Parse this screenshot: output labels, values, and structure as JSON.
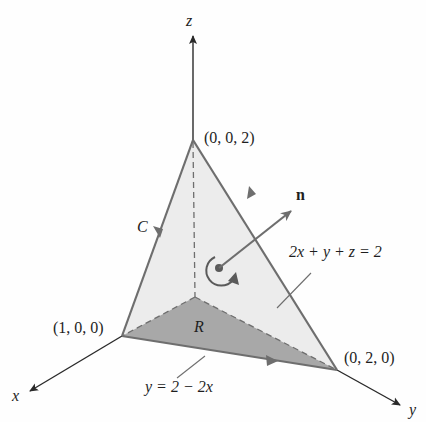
{
  "diagram": {
    "type": "3D surface with boundary curve (Stokes' theorem illustration)",
    "axes": {
      "x_label": "x",
      "y_label": "y",
      "z_label": "z"
    },
    "vertices": {
      "z_intercept": "(0, 0, 2)",
      "x_intercept": "(1, 0, 0)",
      "y_intercept": "(0, 2, 0)"
    },
    "labels": {
      "curve": "C",
      "region": "R",
      "normal": "n",
      "plane_equation": "2x + y + z = 2",
      "boundary_line": "y = 2 − 2x"
    },
    "colors": {
      "surface_fill": "#ececec",
      "region_fill": "#a8a8a8",
      "edge_stroke": "#6e6e6e",
      "axis_stroke": "#2a2a2a",
      "text": "#1e1e1e"
    }
  }
}
